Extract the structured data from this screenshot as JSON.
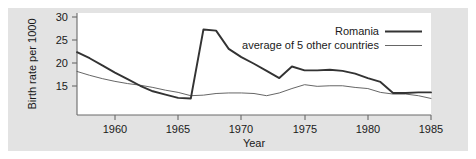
{
  "chart_data": {
    "type": "line",
    "title": "",
    "xlabel": "Year",
    "ylabel": "Birth rate per 1000",
    "xlim": [
      1957,
      1985
    ],
    "ylim": [
      11.5,
      30
    ],
    "xticks": [
      1960,
      1965,
      1970,
      1975,
      1980,
      1985
    ],
    "xtick_labels": [
      "1960",
      "1965",
      "1970",
      "1975",
      "1980",
      "1985"
    ],
    "yticks": [
      15,
      20,
      25,
      30
    ],
    "ytick_labels": [
      "15",
      "20",
      "25",
      "30"
    ],
    "grid": false,
    "legend_position": "top-right",
    "x": [
      1957,
      1958,
      1959,
      1960,
      1961,
      1962,
      1963,
      1964,
      1965,
      1966,
      1967,
      1968,
      1969,
      1970,
      1971,
      1972,
      1973,
      1974,
      1975,
      1976,
      1977,
      1978,
      1979,
      1980,
      1981,
      1982,
      1983,
      1984,
      1985
    ],
    "series": [
      {
        "name": "Romania",
        "style": "thick",
        "color": "#333333",
        "values": [
          22.9,
          21.8,
          20.5,
          19.2,
          18.0,
          16.8,
          15.8,
          15.2,
          14.6,
          14.5,
          27.0,
          26.8,
          23.5,
          22.0,
          20.8,
          19.5,
          18.2,
          20.3,
          19.6,
          19.6,
          19.7,
          19.5,
          19.0,
          18.2,
          17.5,
          15.5,
          15.5,
          15.6,
          15.6
        ]
      },
      {
        "name": "average of 5 other countries",
        "style": "thin",
        "color": "#555555",
        "values": [
          19.4,
          18.7,
          18.1,
          17.6,
          17.2,
          16.9,
          16.5,
          16.0,
          15.6,
          15.0,
          15.1,
          15.4,
          15.5,
          15.5,
          15.4,
          15.0,
          15.5,
          16.3,
          17.0,
          16.7,
          16.8,
          16.8,
          16.5,
          16.3,
          15.6,
          15.3,
          15.3,
          15.0,
          14.5
        ]
      }
    ]
  },
  "legend": {
    "items": [
      {
        "label": "Romania",
        "style": "thick"
      },
      {
        "label": "average of 5 other countries",
        "style": "thin"
      }
    ]
  },
  "axes": {
    "x_title": "Year",
    "y_title": "Birth rate per 1000"
  },
  "colors": {
    "figure_background": "#e3e3e3",
    "plot_background": "#ffffff",
    "axis": "#555555",
    "series_primary": "#333333",
    "series_secondary": "#555555"
  }
}
